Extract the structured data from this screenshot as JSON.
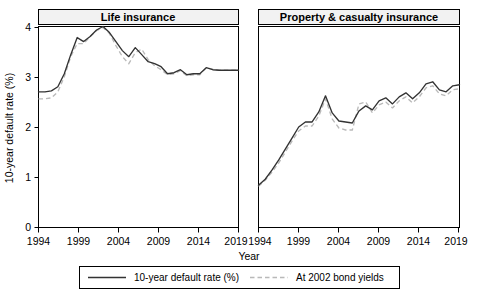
{
  "figure": {
    "y_axis_title": "10-year default rate (%)",
    "x_axis_title": "Year",
    "y_ticks": [
      "0",
      "1",
      "2",
      "3",
      "4"
    ],
    "y_tick_values": [
      0,
      1,
      2,
      3,
      4
    ],
    "x_ticks": [
      "1994",
      "1999",
      "2004",
      "2009",
      "2014",
      "2019"
    ],
    "x_tick_values": [
      1994,
      1999,
      2004,
      2009,
      2014,
      2019
    ],
    "panels": [
      {
        "title": "Life insurance"
      },
      {
        "title": "Property & casualty insurance"
      }
    ],
    "legend": {
      "items": [
        {
          "label": "10-year default rate (%)",
          "style": "solid",
          "color": "#333333"
        },
        {
          "label": "At 2002 bond yields",
          "style": "dashed",
          "color": "#b9b9b9"
        }
      ]
    }
  },
  "chart_data": [
    {
      "type": "line",
      "title": "Life insurance",
      "xlabel": "Year",
      "ylabel": "10-year default rate (%)",
      "xlim": [
        1994,
        2019
      ],
      "ylim": [
        0,
        4
      ],
      "grid": false,
      "legend_position": "bottom",
      "x": [
        1994,
        1995,
        1996,
        1997,
        1998,
        1999,
        2000,
        2001,
        2002,
        2003,
        2004,
        2005,
        2006,
        2007,
        2008,
        2009,
        2010,
        2011,
        2012,
        2013,
        2014,
        2015,
        2016,
        2017,
        2018,
        2019
      ],
      "series": [
        {
          "name": "10-year default rate (%)",
          "style": "solid",
          "color": "#333333",
          "values": [
            2.7,
            2.7,
            2.72,
            2.8,
            3.06,
            3.44,
            3.78,
            3.7,
            3.8,
            3.93,
            4.0,
            3.88,
            3.7,
            3.52,
            3.4,
            3.58,
            3.44,
            3.3,
            3.26,
            3.2,
            3.06,
            3.08,
            3.14,
            3.04,
            3.06,
            3.06,
            3.18,
            3.14,
            3.13,
            3.13,
            3.13,
            3.13
          ]
        },
        {
          "name": "At 2002 bond yields",
          "style": "dashed",
          "color": "#b9b9b9",
          "values": [
            2.56,
            2.56,
            2.58,
            2.7,
            3.0,
            3.4,
            3.66,
            3.66,
            3.8,
            3.92,
            3.98,
            3.86,
            3.62,
            3.4,
            3.26,
            3.48,
            3.55,
            3.34,
            3.22,
            3.14,
            3.04,
            3.06,
            3.12,
            3.02,
            3.04,
            3.04,
            3.18,
            3.15,
            3.13,
            3.13,
            3.13,
            3.13
          ]
        }
      ]
    },
    {
      "type": "line",
      "title": "Property & casualty insurance",
      "xlabel": "Year",
      "ylabel": "10-year default rate (%)",
      "xlim": [
        1994,
        2019
      ],
      "ylim": [
        0,
        4
      ],
      "grid": false,
      "legend_position": "bottom",
      "x": [
        1994,
        1995,
        1996,
        1997,
        1998,
        1999,
        2000,
        2001,
        2002,
        2003,
        2004,
        2005,
        2006,
        2007,
        2008,
        2009,
        2010,
        2011,
        2012,
        2013,
        2014,
        2015,
        2016,
        2017,
        2018,
        2019
      ],
      "series": [
        {
          "name": "10-year default rate (%)",
          "style": "solid",
          "color": "#333333",
          "values": [
            0.84,
            0.96,
            1.14,
            1.34,
            1.56,
            1.78,
            2.0,
            2.1,
            2.1,
            2.3,
            2.62,
            2.28,
            2.12,
            2.1,
            2.08,
            2.32,
            2.42,
            2.34,
            2.52,
            2.58,
            2.46,
            2.6,
            2.68,
            2.56,
            2.68,
            2.86,
            2.9,
            2.74,
            2.7,
            2.82,
            2.84
          ]
        },
        {
          "name": "At 2002 bond yields",
          "style": "dashed",
          "color": "#b9b9b9",
          "values": [
            0.82,
            0.94,
            1.1,
            1.28,
            1.5,
            1.72,
            1.92,
            2.02,
            2.02,
            2.22,
            2.56,
            2.16,
            1.98,
            1.94,
            1.94,
            2.46,
            2.5,
            2.28,
            2.44,
            2.5,
            2.38,
            2.52,
            2.6,
            2.48,
            2.6,
            2.78,
            2.82,
            2.66,
            2.62,
            2.74,
            2.76
          ]
        }
      ]
    }
  ]
}
